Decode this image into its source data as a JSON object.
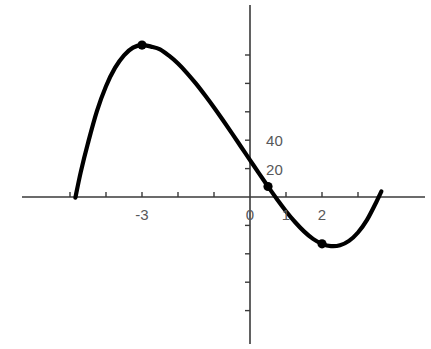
{
  "chart_data": {
    "type": "line",
    "title": "",
    "subtitle": "",
    "xlabel": "",
    "ylabel": "",
    "xlim": [
      -4.9,
      3.75
    ],
    "ylim": [
      -95,
      135
    ],
    "grid": false,
    "legend": null,
    "axis_color": "#3a3a3a",
    "curve_color": "#000000",
    "marker_color": "#000000",
    "label_color": "#58585a",
    "x_ticks": [
      -5,
      -4,
      -3,
      -2,
      -1,
      0,
      1,
      2,
      3
    ],
    "x_tick_labels": [
      "",
      "",
      "-3",
      "",
      "",
      "0",
      "1",
      "2",
      ""
    ],
    "y_ticks": [
      -80,
      -60,
      -40,
      -20,
      20,
      40,
      60,
      80,
      100
    ],
    "y_tick_labels": [
      "",
      "",
      "",
      "",
      "20",
      "40",
      "",
      "",
      ""
    ],
    "series": [
      {
        "name": "f(x)",
        "expression": "2x^3 + 3x^2 - 36x + 14",
        "x": [
          -4.85,
          -4.7,
          -4.5,
          -4.25,
          -4.0,
          -3.75,
          -3.5,
          -3.25,
          -3.0,
          -2.75,
          -2.5,
          -2.25,
          -2.0,
          -1.75,
          -1.5,
          -1.25,
          -1.0,
          -0.75,
          -0.5,
          -0.25,
          0.0,
          0.25,
          0.5,
          0.75,
          1.0,
          1.25,
          1.5,
          1.75,
          2.0,
          2.25,
          2.5,
          2.75,
          3.0,
          3.25,
          3.5,
          3.65
        ],
        "y": [
          -0.4,
          17.7,
          38.0,
          60.6,
          78.0,
          90.9,
          99.8,
          105.2,
          107.0,
          105.9,
          104.0,
          99.5,
          94.0,
          87.3,
          79.8,
          71.6,
          63.0,
          54.0,
          44.8,
          35.4,
          26.0,
          16.6,
          7.4,
          -1.6,
          -10.0,
          -17.6,
          -24.2,
          -29.5,
          -33.0,
          -34.6,
          -34.0,
          -30.9,
          -25.0,
          -16.1,
          -4.0,
          3.9
        ]
      }
    ],
    "markers": [
      {
        "x": -3.0,
        "y": 107,
        "label": "local-maximum"
      },
      {
        "x": 0.5,
        "y": 7.4,
        "label": "inflection-point"
      },
      {
        "x": 2.0,
        "y": -33,
        "label": "local-minimum"
      }
    ]
  },
  "axes": {
    "x_axis_name": "x-axis",
    "y_axis_name": "y-axis"
  }
}
